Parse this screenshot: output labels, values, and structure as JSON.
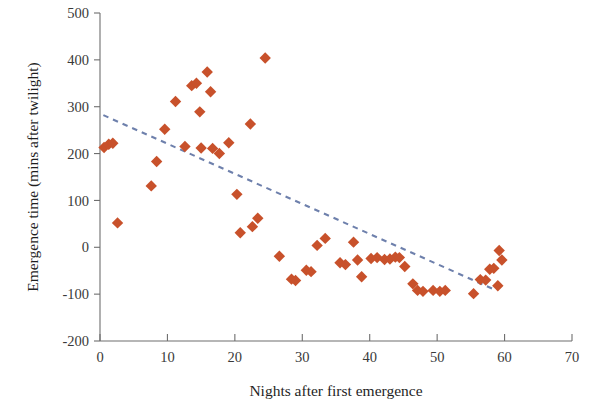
{
  "chart_data": {
    "type": "scatter",
    "title": "",
    "subtitle": "",
    "xlabel": "Nights after first emergence",
    "ylabel": "Emergence time (mins after twilight)",
    "xlim": [
      0,
      70
    ],
    "ylim": [
      -200,
      500
    ],
    "xticks": [
      0,
      10,
      20,
      30,
      40,
      50,
      60,
      70
    ],
    "yticks": [
      -200,
      -100,
      0,
      100,
      200,
      300,
      400,
      500
    ],
    "xtick_labels": [
      "0",
      "10",
      "20",
      "30",
      "40",
      "50",
      "60",
      "70"
    ],
    "ytick_labels": [
      "-200",
      "-100",
      "0",
      "100",
      "200",
      "300",
      "400",
      "500"
    ],
    "grid": false,
    "legend": "none",
    "marker_shape": "diamond",
    "marker_color": "#C8512B",
    "marker_size": 9,
    "points": [
      {
        "x": 0.6,
        "y": 213
      },
      {
        "x": 1.3,
        "y": 220
      },
      {
        "x": 1.9,
        "y": 222
      },
      {
        "x": 2.6,
        "y": 52
      },
      {
        "x": 7.6,
        "y": 131
      },
      {
        "x": 8.4,
        "y": 183
      },
      {
        "x": 9.6,
        "y": 252
      },
      {
        "x": 11.2,
        "y": 311
      },
      {
        "x": 12.6,
        "y": 215
      },
      {
        "x": 13.6,
        "y": 345
      },
      {
        "x": 14.3,
        "y": 350
      },
      {
        "x": 14.8,
        "y": 289
      },
      {
        "x": 15.0,
        "y": 212
      },
      {
        "x": 15.9,
        "y": 374
      },
      {
        "x": 16.4,
        "y": 332
      },
      {
        "x": 16.7,
        "y": 211
      },
      {
        "x": 17.7,
        "y": 200
      },
      {
        "x": 19.1,
        "y": 223
      },
      {
        "x": 20.3,
        "y": 113
      },
      {
        "x": 20.8,
        "y": 31
      },
      {
        "x": 22.3,
        "y": 263
      },
      {
        "x": 22.6,
        "y": 44
      },
      {
        "x": 23.4,
        "y": 62
      },
      {
        "x": 24.5,
        "y": 404
      },
      {
        "x": 26.6,
        "y": -19
      },
      {
        "x": 28.4,
        "y": -68
      },
      {
        "x": 29.0,
        "y": -71
      },
      {
        "x": 30.6,
        "y": -49
      },
      {
        "x": 31.3,
        "y": -52
      },
      {
        "x": 32.2,
        "y": 4
      },
      {
        "x": 33.4,
        "y": 19
      },
      {
        "x": 35.6,
        "y": -33
      },
      {
        "x": 36.4,
        "y": -37
      },
      {
        "x": 37.6,
        "y": 11
      },
      {
        "x": 38.2,
        "y": -27
      },
      {
        "x": 38.8,
        "y": -63
      },
      {
        "x": 40.2,
        "y": -24
      },
      {
        "x": 41.1,
        "y": -22
      },
      {
        "x": 42.2,
        "y": -26
      },
      {
        "x": 43.0,
        "y": -25
      },
      {
        "x": 43.8,
        "y": -21
      },
      {
        "x": 44.4,
        "y": -22
      },
      {
        "x": 45.2,
        "y": -41
      },
      {
        "x": 46.4,
        "y": -78
      },
      {
        "x": 47.1,
        "y": -92
      },
      {
        "x": 47.9,
        "y": -94
      },
      {
        "x": 49.4,
        "y": -92
      },
      {
        "x": 50.4,
        "y": -94
      },
      {
        "x": 51.2,
        "y": -92
      },
      {
        "x": 55.4,
        "y": -99
      },
      {
        "x": 56.4,
        "y": -69
      },
      {
        "x": 57.2,
        "y": -70
      },
      {
        "x": 57.8,
        "y": -47
      },
      {
        "x": 58.4,
        "y": -45
      },
      {
        "x": 59.0,
        "y": -82
      },
      {
        "x": 59.6,
        "y": -27
      },
      {
        "x": 59.2,
        "y": -7
      }
    ],
    "trendline": {
      "style": "dashed",
      "color": "#6E80AC",
      "x_start": 0.5,
      "y_start": 282,
      "x_end": 58.6,
      "y_end": -91
    }
  }
}
